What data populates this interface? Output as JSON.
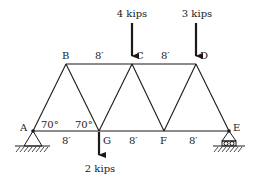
{
  "diagram": {
    "type": "truss",
    "joints": {
      "A": {
        "label": "A",
        "x": 33,
        "y": 131
      },
      "B": {
        "label": "B",
        "x": 66,
        "y": 64
      },
      "C": {
        "label": "C",
        "x": 132,
        "y": 64
      },
      "D": {
        "label": "D",
        "x": 196,
        "y": 64
      },
      "E": {
        "label": "E",
        "x": 229,
        "y": 131
      },
      "F": {
        "label": "F",
        "x": 164,
        "y": 131
      },
      "G": {
        "label": "G",
        "x": 99,
        "y": 131
      }
    },
    "members": [
      [
        "A",
        "B"
      ],
      [
        "B",
        "C"
      ],
      [
        "C",
        "D"
      ],
      [
        "A",
        "G"
      ],
      [
        "G",
        "F"
      ],
      [
        "F",
        "E"
      ],
      [
        "B",
        "G"
      ],
      [
        "G",
        "C"
      ],
      [
        "C",
        "F"
      ],
      [
        "F",
        "D"
      ],
      [
        "D",
        "E"
      ]
    ],
    "dimensions": {
      "BC": "8′",
      "CD": "8′",
      "AG": "8′",
      "GF": "8′",
      "FE": "8′"
    },
    "angles": {
      "at_A": "70°",
      "at_G": "70°"
    },
    "loads": {
      "C": "4 kips",
      "D": "3 kips",
      "G": "2 kips"
    },
    "supports": {
      "A": "pin",
      "E": "roller"
    }
  }
}
